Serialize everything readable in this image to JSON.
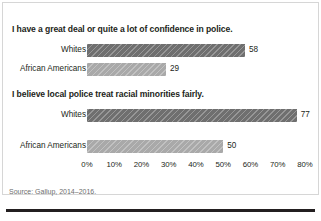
{
  "source_note": "Source: Gallup, 2014–2016.",
  "panels": [
    {
      "title": "I have a great deal or quite a lot of confidence in police.",
      "rows": [
        {
          "label": "Whites",
          "value": 58,
          "value_text": "58",
          "shade": "dark"
        },
        {
          "label": "African Americans",
          "value": 29,
          "value_text": "29",
          "shade": "light"
        }
      ]
    },
    {
      "title": "I believe local police treat racial minorities fairly.",
      "rows": [
        {
          "label": "Whites",
          "value": 77,
          "value_text": "77",
          "shade": "dark"
        },
        {
          "label": "African Americans",
          "value": 50,
          "value_text": "50",
          "shade": "light"
        }
      ]
    }
  ],
  "axis": {
    "ticks": [
      "0%",
      "10%",
      "20%",
      "30%",
      "40%",
      "50%",
      "60%",
      "70%",
      "80%"
    ],
    "min": 0,
    "max": 80
  },
  "colors": {
    "bar_dark": "#6f6f6f",
    "bar_light": "#a9a9a9",
    "text": "#231f20",
    "source_text": "#6d6d6d",
    "frame": "#d6d6d6",
    "rule": "#231f20"
  },
  "chart_data": {
    "type": "bar",
    "title": "",
    "orientation": "horizontal",
    "xlabel": "",
    "ylabel": "",
    "xlim": [
      0,
      80
    ],
    "grid": false,
    "legend": "none",
    "panels": [
      {
        "title": "I have a great deal or quite a lot of confidence in police.",
        "categories": [
          "Whites",
          "African Americans"
        ],
        "values": [
          58,
          29
        ]
      },
      {
        "title": "I believe local police treat racial minorities fairly.",
        "categories": [
          "Whites",
          "African Americans"
        ],
        "values": [
          77,
          50
        ]
      }
    ],
    "tick_labels": [
      "0%",
      "10%",
      "20%",
      "30%",
      "40%",
      "50%",
      "60%",
      "70%",
      "80%"
    ],
    "annotations": [
      "Source: Gallup, 2014–2016."
    ]
  }
}
